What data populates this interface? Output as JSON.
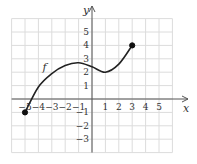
{
  "chart_data": {
    "type": "line",
    "title": "",
    "xlabel": "x",
    "ylabel": "y",
    "function_label": "f",
    "xlim": [
      -6,
      6
    ],
    "ylim": [
      -4,
      6
    ],
    "grid": true,
    "x_ticks": [
      -5,
      -4,
      -3,
      -2,
      -1,
      1,
      2,
      3,
      4,
      5
    ],
    "y_ticks": [
      -3,
      -2,
      -1,
      1,
      2,
      3,
      4,
      5
    ],
    "x_tick_labels": [
      "−5",
      "−4",
      "−3",
      "−2",
      "−1",
      "1",
      "2",
      "3",
      "4",
      "5"
    ],
    "y_tick_labels": [
      "−3",
      "−2",
      "−1",
      "1",
      "2",
      "3",
      "4",
      "5"
    ],
    "series": [
      {
        "name": "f",
        "points": [
          [
            -5,
            -1
          ],
          [
            -4,
            0.9
          ],
          [
            -3,
            1.9
          ],
          [
            -2,
            2.5
          ],
          [
            -1,
            2.7
          ],
          [
            0,
            2.4
          ],
          [
            1,
            2
          ],
          [
            2,
            2.6
          ],
          [
            3,
            4
          ]
        ],
        "endpoints": [
          {
            "x": -5,
            "y": -1,
            "style": "filled"
          },
          {
            "x": 3,
            "y": 4,
            "style": "filled"
          }
        ]
      }
    ],
    "features": {
      "local_max": {
        "x": -1,
        "y": 2.7
      },
      "local_min": {
        "x": 1,
        "y": 2
      }
    }
  }
}
